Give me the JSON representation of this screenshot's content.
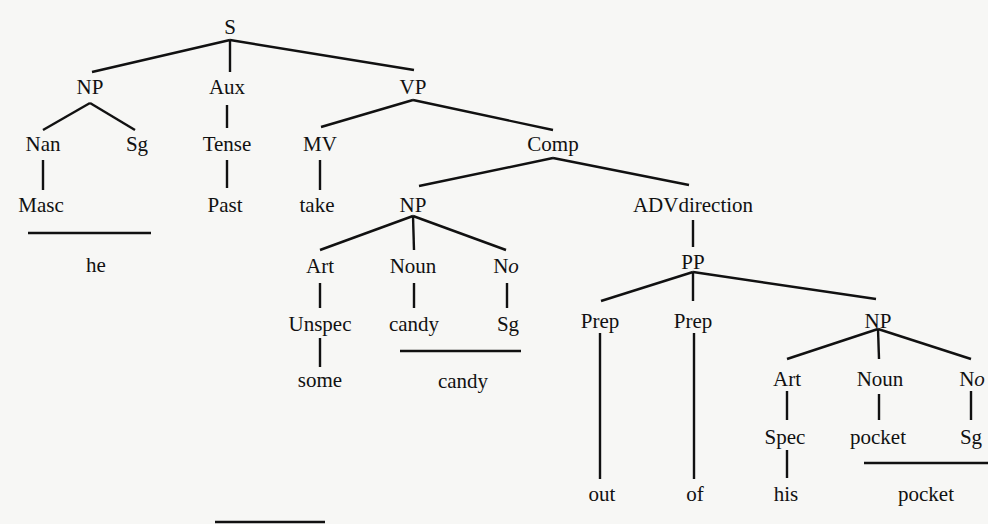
{
  "diagram": {
    "type": "syntax-tree",
    "sentence": "he take+Past some candy out of his pocket",
    "nodes": [
      {
        "id": "S",
        "label": "S",
        "x": 230,
        "y": 27
      },
      {
        "id": "NP1",
        "label": "NP",
        "x": 90,
        "y": 87
      },
      {
        "id": "Aux",
        "label": "Aux",
        "x": 227,
        "y": 87
      },
      {
        "id": "VP",
        "label": "VP",
        "x": 413,
        "y": 87
      },
      {
        "id": "Nan",
        "label": "Nan",
        "x": 43,
        "y": 144
      },
      {
        "id": "Sg1",
        "label": "Sg",
        "x": 137,
        "y": 144
      },
      {
        "id": "Tense",
        "label": "Tense",
        "x": 227,
        "y": 144
      },
      {
        "id": "MV",
        "label": "MV",
        "x": 320,
        "y": 144
      },
      {
        "id": "Comp",
        "label": "Comp",
        "x": 553,
        "y": 144
      },
      {
        "id": "Masc",
        "label": "Masc",
        "x": 41,
        "y": 205
      },
      {
        "id": "Past",
        "label": "Past",
        "x": 225,
        "y": 205
      },
      {
        "id": "take",
        "label": "take",
        "x": 317,
        "y": 205
      },
      {
        "id": "NP2",
        "label": "NP",
        "x": 413,
        "y": 205
      },
      {
        "id": "ADVdir",
        "label": "ADVdirection",
        "x": 693,
        "y": 205
      },
      {
        "id": "he",
        "label": "he",
        "x": 96,
        "y": 265
      },
      {
        "id": "Art1",
        "label": "Art",
        "x": 320,
        "y": 266
      },
      {
        "id": "Noun1",
        "label": "Noun",
        "x": 413,
        "y": 266
      },
      {
        "id": "No1",
        "label": "No",
        "x": 506,
        "y": 266,
        "italic_suffix": true
      },
      {
        "id": "PP",
        "label": "PP",
        "x": 693,
        "y": 262
      },
      {
        "id": "Unspec",
        "label": "Unspec",
        "x": 320,
        "y": 324
      },
      {
        "id": "candy1",
        "label": "candy",
        "x": 414,
        "y": 324
      },
      {
        "id": "Sg2",
        "label": "Sg",
        "x": 508,
        "y": 324
      },
      {
        "id": "Prep1",
        "label": "Prep",
        "x": 600,
        "y": 321
      },
      {
        "id": "Prep2",
        "label": "Prep",
        "x": 693,
        "y": 321
      },
      {
        "id": "NP3",
        "label": "NP",
        "x": 878,
        "y": 321
      },
      {
        "id": "some",
        "label": "some",
        "x": 320,
        "y": 380
      },
      {
        "id": "candy2",
        "label": "candy",
        "x": 463,
        "y": 381
      },
      {
        "id": "Art2",
        "label": "Art",
        "x": 787,
        "y": 379
      },
      {
        "id": "Noun2",
        "label": "Noun",
        "x": 880,
        "y": 379
      },
      {
        "id": "No2",
        "label": "No",
        "x": 972,
        "y": 379,
        "italic_suffix": true
      },
      {
        "id": "Spec",
        "label": "Spec",
        "x": 785,
        "y": 437
      },
      {
        "id": "pocket1",
        "label": "pocket",
        "x": 878,
        "y": 437
      },
      {
        "id": "Sg3",
        "label": "Sg",
        "x": 971,
        "y": 437
      },
      {
        "id": "out",
        "label": "out",
        "x": 602,
        "y": 494
      },
      {
        "id": "of",
        "label": "of",
        "x": 695,
        "y": 494
      },
      {
        "id": "his",
        "label": "his",
        "x": 786,
        "y": 494
      },
      {
        "id": "pocket2",
        "label": "pocket",
        "x": 926,
        "y": 494
      }
    ],
    "edges": [
      [
        230,
        40,
        92,
        72
      ],
      [
        230,
        40,
        230,
        72
      ],
      [
        230,
        40,
        414,
        70
      ],
      [
        90,
        103,
        43,
        130
      ],
      [
        90,
        103,
        135,
        130
      ],
      [
        227,
        105,
        227,
        128
      ],
      [
        413,
        100,
        321,
        127
      ],
      [
        413,
        100,
        553,
        130
      ],
      [
        43,
        160,
        43,
        190
      ],
      [
        227,
        160,
        227,
        188
      ],
      [
        320,
        160,
        320,
        190
      ],
      [
        553,
        158,
        419,
        186
      ],
      [
        553,
        158,
        689,
        185
      ],
      [
        413,
        216,
        320,
        250
      ],
      [
        413,
        216,
        414,
        250
      ],
      [
        413,
        216,
        506,
        250
      ],
      [
        693,
        220,
        693,
        247
      ],
      [
        320,
        283,
        320,
        308
      ],
      [
        414,
        283,
        414,
        308
      ],
      [
        507,
        283,
        507,
        308
      ],
      [
        320,
        338,
        320,
        367
      ],
      [
        693,
        272,
        601,
        301
      ],
      [
        693,
        272,
        693,
        301
      ],
      [
        693,
        272,
        876,
        299
      ],
      [
        600,
        333,
        600,
        479
      ],
      [
        694,
        333,
        694,
        479
      ],
      [
        878,
        329,
        787,
        359
      ],
      [
        878,
        329,
        879,
        359
      ],
      [
        878,
        329,
        971,
        359
      ],
      [
        787,
        391,
        787,
        420
      ],
      [
        879,
        394,
        879,
        420
      ],
      [
        971,
        391,
        971,
        420
      ],
      [
        787,
        450,
        787,
        478
      ]
    ],
    "underlines": [
      {
        "under": "Masc Sg",
        "result": "he",
        "x1": 28,
        "x2": 151,
        "y": 233
      },
      {
        "under": "candy Sg",
        "result": "candy",
        "x1": 400,
        "x2": 521,
        "y": 351
      },
      {
        "under": "pocket Sg",
        "result": "pocket",
        "x1": 864,
        "x2": 988,
        "y": 463
      },
      {
        "under": "",
        "result": "",
        "x1": 215,
        "x2": 325,
        "y": 522
      }
    ],
    "colors": {
      "ink": "#111111",
      "paper": "#f7f7f5"
    }
  }
}
